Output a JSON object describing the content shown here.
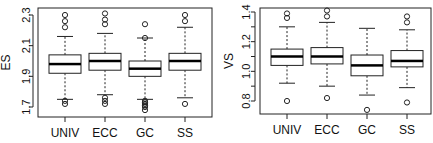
{
  "chart_data": [
    {
      "type": "boxplot",
      "title": "",
      "xlabel": "",
      "ylabel": "ES",
      "categories": [
        "UNIV",
        "ECC",
        "GC",
        "SS"
      ],
      "yticks": [
        1.7,
        1.9,
        2.1,
        2.3
      ],
      "ytick_labels": [
        "1.7",
        "1.9",
        "2.1",
        "2.3"
      ],
      "ylim": [
        1.66,
        2.34
      ],
      "grid": false,
      "legend": null,
      "boxes": [
        {
          "name": "UNIV",
          "whisker_low": 1.75,
          "q1": 1.92,
          "median": 1.98,
          "q3": 2.04,
          "whisker_high": 2.16,
          "outliers": [
            2.22,
            2.26,
            2.3,
            1.74,
            1.72
          ]
        },
        {
          "name": "ECC",
          "whisker_low": 1.78,
          "q1": 1.94,
          "median": 2.0,
          "q3": 2.05,
          "whisker_high": 2.18,
          "outliers": [
            2.24,
            2.27,
            2.31,
            1.76,
            1.74,
            1.72
          ]
        },
        {
          "name": "GC",
          "whisker_low": 1.75,
          "q1": 1.9,
          "median": 1.95,
          "q3": 2.0,
          "whisker_high": 2.15,
          "outliers": [
            2.24,
            2.15,
            1.74,
            1.73,
            1.72,
            1.71,
            1.7,
            1.68
          ]
        },
        {
          "name": "SS",
          "whisker_low": 1.76,
          "q1": 1.94,
          "median": 2.0,
          "q3": 2.05,
          "whisker_high": 2.22,
          "outliers": [
            2.26,
            2.3,
            1.72
          ]
        }
      ]
    },
    {
      "type": "boxplot",
      "title": "",
      "xlabel": "",
      "ylabel": "VS",
      "categories": [
        "UNIV",
        "ECC",
        "GC",
        "SS"
      ],
      "yticks": [
        0.8,
        0.9,
        1.0,
        1.1,
        1.2,
        1.3,
        1.4
      ],
      "ytick_labels": [
        "0.8",
        "",
        "1.0",
        "",
        "1.2",
        "",
        "1.4"
      ],
      "ylim": [
        0.72,
        1.43
      ],
      "grid": false,
      "legend": null,
      "boxes": [
        {
          "name": "UNIV",
          "whisker_low": 0.92,
          "q1": 1.04,
          "median": 1.1,
          "q3": 1.15,
          "whisker_high": 1.3,
          "outliers": [
            1.36,
            1.39,
            0.8
          ]
        },
        {
          "name": "ECC",
          "whisker_low": 0.9,
          "q1": 1.05,
          "median": 1.1,
          "q3": 1.16,
          "whisker_high": 1.33,
          "outliers": [
            1.37,
            1.41,
            0.82
          ]
        },
        {
          "name": "GC",
          "whisker_low": 0.84,
          "q1": 0.97,
          "median": 1.04,
          "q3": 1.11,
          "whisker_high": 1.29,
          "outliers": [
            0.74
          ]
        },
        {
          "name": "SS",
          "whisker_low": 0.89,
          "q1": 1.03,
          "median": 1.07,
          "q3": 1.14,
          "whisker_high": 1.28,
          "outliers": [
            1.33,
            1.37,
            0.79
          ]
        }
      ]
    }
  ],
  "layout": [
    {
      "x0": 38,
      "x1": 212,
      "y0": 8,
      "y1": 117,
      "box_x": [
        65,
        105,
        145,
        185
      ],
      "ypx_top": 15,
      "yval_top": 2.3,
      "ypx_bot": 107,
      "yval_bot": 1.7,
      "ylabel_x": 10,
      "tick_label_x": 30
    },
    {
      "x0": 260,
      "x1": 431,
      "y0": 8,
      "y1": 114,
      "box_x": [
        287,
        327,
        367,
        407
      ],
      "ypx_top": 12,
      "yval_top": 1.4,
      "ypx_bot": 101,
      "yval_bot": 0.8,
      "ylabel_x": 233,
      "tick_label_x": 250
    }
  ]
}
